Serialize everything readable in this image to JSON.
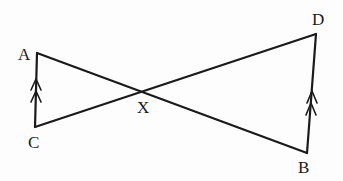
{
  "figure": {
    "stroke_color": "#1a1a1a",
    "points": {
      "A": {
        "label": "A",
        "x": 37,
        "y": 53,
        "lx": 18,
        "ly": 60
      },
      "C": {
        "label": "C",
        "x": 35,
        "y": 127,
        "lx": 28,
        "ly": 148
      },
      "X": {
        "label": "X",
        "x": 140,
        "y": 91,
        "lx": 137,
        "ly": 113
      },
      "D": {
        "label": "D",
        "x": 316,
        "y": 34,
        "lx": 312,
        "ly": 25
      },
      "B": {
        "label": "B",
        "x": 307,
        "y": 153,
        "lx": 298,
        "ly": 173
      }
    },
    "segments": [
      "AC",
      "AB",
      "CD",
      "DB"
    ],
    "parallel_marks": {
      "AC": {
        "count": 2,
        "direction": "up"
      },
      "BD": {
        "count": 2,
        "direction": "up"
      }
    }
  }
}
